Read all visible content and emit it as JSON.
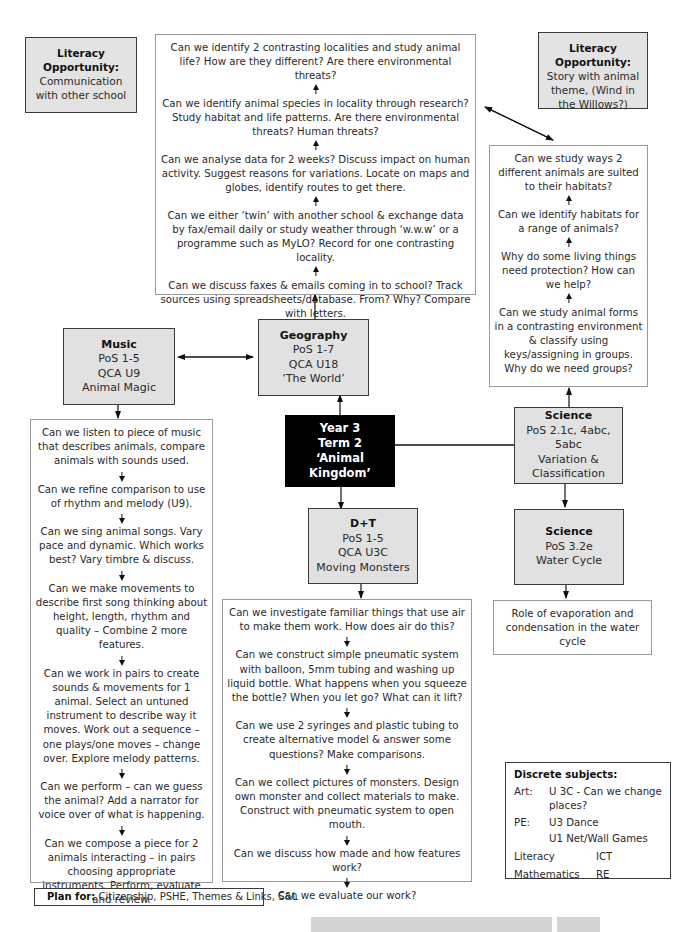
{
  "central": {
    "line1": "Year 3",
    "line2": "Term 2",
    "line3": "‘Animal Kingdom’"
  },
  "literacy_left": {
    "title1": "Literacy",
    "title2": "Opportunity:",
    "text": "Communication with other school"
  },
  "literacy_right": {
    "title1": "Literacy",
    "title2": "Opportunity:",
    "text": "Story with animal theme, (Wind in the Willows?)"
  },
  "geography": {
    "title": "Geography",
    "pos": "PoS 1-7",
    "qca": "QCA U18",
    "unit": "‘The World’",
    "questions": [
      "Can we identify 2 contrasting localities and study animal life? How are they different? Are there environmental threats?",
      "Can we identify animal species in locality through research? Study habitat and life patterns.  Are there environmental threats? Human threats?",
      "Can we analyse data for 2 weeks?  Discuss impact on human activity. Suggest reasons for variations. Locate on maps and globes, identify routes to get there.",
      "Can we either ‘twin’ with another school & exchange data by fax/email daily or study weather through ‘w.w.w’ or a programme such as MyLO? Record for one contrasting locality.",
      "Can we discuss faxes & emails coming in to school? Track sources using spreadsheets/database. From? Why? Compare with letters."
    ]
  },
  "music": {
    "title": "Music",
    "pos": "PoS 1-5",
    "qca": "QCA U9",
    "unit": "Animal Magic",
    "questions": [
      "Can we listen to piece of music that describes animals, compare animals with sounds used.",
      "Can we refine comparison to use of rhythm and melody (U9).",
      "Can we sing animal songs.  Vary pace and dynamic.  Which works best? Vary timbre & discuss.",
      "Can we make movements to describe first song thinking about height, length, rhythm and quality – Combine 2 more features.",
      "Can we work in pairs to create sounds & movements for 1 animal. Select an untuned instrument to describe way it moves.  Work out a sequence – one plays/one moves – change over.  Explore melody patterns.",
      "Can we perform – can we guess the animal?  Add a narrator for voice over of what is happening.",
      "Can we compose a piece for 2 animals interacting – in pairs choosing appropriate instruments. Perform, evaluate and review."
    ]
  },
  "dt": {
    "title": "D+T",
    "pos": "PoS 1-5",
    "qca": "QCA U3C",
    "unit": "Moving Monsters",
    "questions": [
      "Can we investigate familiar things that use air to make them work. How does air do this?",
      "Can we construct simple pneumatic system with balloon, 5mm tubing and washing up liquid bottle.  What happens when you squeeze the bottle? When you let go? What can it lift?",
      "Can we use 2 syringes and plastic tubing to create alternative model & answer some questions? Make comparisons.",
      "Can we collect pictures of monsters.  Design own monster and collect materials to make. Construct with pneumatic system to open mouth.",
      "Can we discuss how made and how features work?",
      "Can we evaluate our work?"
    ]
  },
  "science1": {
    "title": "Science",
    "pos": "PoS 2.1c, 4abc, 5abc",
    "unit1": "Variation &",
    "unit2": "Classification",
    "questions": [
      "Can we study ways 2 different animals are suited to their habitats?",
      "Can we identify habitats for a range of animals?",
      "Why do some living things need protection? How can we help?",
      "Can we study animal forms in a contrasting environment & classify using keys/assigning in groups. Why do we need groups?"
    ]
  },
  "science2": {
    "title": "Science",
    "pos": "PoS 3.2e",
    "unit": "Water Cycle",
    "questions": [
      "Role of evaporation and condensation in the water cycle"
    ]
  },
  "discrete": {
    "title": "Discrete subjects:",
    "art_label": "Art:",
    "art_value": "U 3C - Can we change places?",
    "pe_label": "PE:",
    "pe_value1": "U3 Dance",
    "pe_value2": "U1 Net/Wall Games",
    "row1_a": "Literacy",
    "row1_b": "ICT",
    "row2_a": "Mathematics",
    "row2_b": "RE"
  },
  "plan_for": {
    "label": "Plan for:",
    "text": " Citizenship, PSHE, Themes & Links, S&L"
  }
}
